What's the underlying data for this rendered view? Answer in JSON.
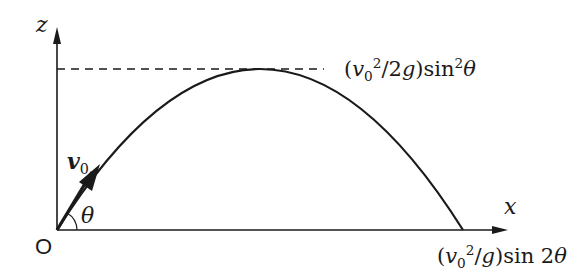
{
  "diagram": {
    "type": "projectile-trajectory",
    "axes": {
      "x_label": "x",
      "z_label": "z",
      "origin_label": "O"
    },
    "launch": {
      "velocity_label": "v",
      "velocity_sub": "0",
      "angle_label": "θ"
    },
    "annotations": {
      "max_height": {
        "open": "(",
        "v": "v",
        "v_sub": "0",
        "v_sup": "2",
        "rest": "/2",
        "g": "g",
        "close": ")sin",
        "sin_sup": "2",
        "theta": "θ"
      },
      "range": {
        "open": "(",
        "v": "v",
        "v_sub": "0",
        "v_sup": "2",
        "rest": "/",
        "g": "g",
        "close": ")sin 2",
        "theta": "θ"
      }
    },
    "colors": {
      "stroke": "#1a1a1a",
      "background": "#ffffff"
    }
  }
}
